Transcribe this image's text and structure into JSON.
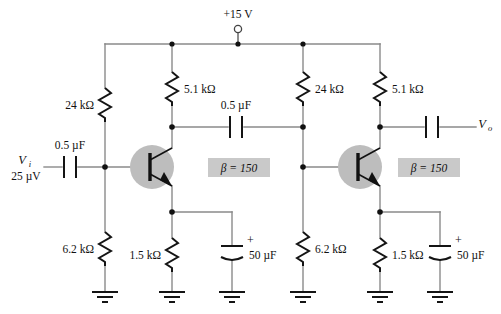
{
  "figure": {
    "background_color": "#ffffff",
    "wire_color": "#8a8a8a",
    "component_color": "#141414",
    "transistor_fill": "#bdbdbd",
    "beta_box_fill": "#c9c9c9"
  },
  "supply": {
    "label": "+15 V",
    "terminal": "open-circle-terminal"
  },
  "input": {
    "signal_label": "V",
    "signal_subscript": "i",
    "amplitude": "25 µV"
  },
  "output": {
    "signal_label": "V",
    "signal_subscript": "o"
  },
  "stage1": {
    "bias_upper_resistor": "24 kΩ",
    "bias_lower_resistor": "6.2 kΩ",
    "collector_resistor": "5.1 kΩ",
    "emitter_resistor": "1.5 kΩ",
    "emitter_bypass_cap": "50 µF",
    "emitter_bypass_polarity": "+",
    "input_coupling_cap": "0.5 µF",
    "transistor_beta": "β = 150",
    "transistor_type": "npn"
  },
  "stage2": {
    "bias_upper_resistor": "24 kΩ",
    "bias_lower_resistor": "6.2 kΩ",
    "collector_resistor": "5.1 kΩ",
    "emitter_resistor": "1.5 kΩ",
    "emitter_bypass_cap": "50 µF",
    "emitter_bypass_polarity": "+",
    "transistor_beta": "β = 150",
    "transistor_type": "npn"
  },
  "coupling": {
    "interstage_cap": "0.5 µF",
    "output_cap_label": ""
  },
  "grounds": {
    "count": 6,
    "symbol": "earth-ground-3-bar"
  }
}
